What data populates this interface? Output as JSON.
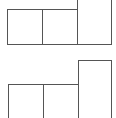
{
  "diagram": {
    "stroke_color": "#555555",
    "background": "#ffffff",
    "groups": [
      {
        "name": "top-group",
        "boxes": [
          {
            "id": "top-left",
            "x": 7,
            "y": 9,
            "w": 36,
            "h": 36
          },
          {
            "id": "top-middle",
            "x": 42,
            "y": 9,
            "w": 36,
            "h": 36
          },
          {
            "id": "top-tall",
            "x": 77,
            "y": -2,
            "w": 35,
            "h": 47,
            "open": "top"
          }
        ]
      },
      {
        "name": "bottom-group",
        "boxes": [
          {
            "id": "bottom-left",
            "x": 8,
            "y": 84,
            "w": 36,
            "h": 36,
            "open": "bottom"
          },
          {
            "id": "bottom-middle",
            "x": 43,
            "y": 84,
            "w": 36,
            "h": 36,
            "open": "bottom"
          },
          {
            "id": "bottom-tall",
            "x": 78,
            "y": 60,
            "w": 34,
            "h": 60,
            "open": "bottom"
          }
        ]
      }
    ]
  }
}
